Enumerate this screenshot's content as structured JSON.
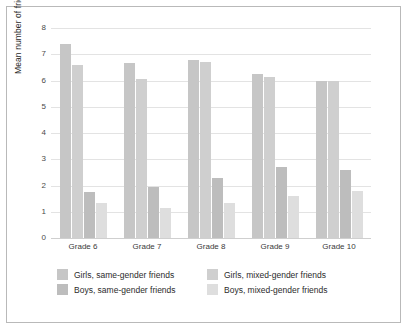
{
  "chart_data": {
    "type": "bar",
    "title": "",
    "xlabel": "",
    "ylabel": "Mean number of friends",
    "categories": [
      "Grade 6",
      "Grade 7",
      "Grade 8",
      "Grade 9",
      "Grade 10"
    ],
    "ylim": [
      0,
      8
    ],
    "yticks": [
      0,
      1,
      2,
      3,
      4,
      5,
      6,
      7,
      8
    ],
    "grid": true,
    "legend_position": "bottom",
    "series": [
      {
        "name": "Girls, same-gender friends",
        "color": "#c6c6c6",
        "values": [
          7.4,
          6.65,
          6.8,
          6.25,
          6.0
        ]
      },
      {
        "name": "Girls, mixed-gender friends",
        "color": "#cfcfcf",
        "values": [
          6.6,
          6.05,
          6.7,
          6.15,
          6.0
        ]
      },
      {
        "name": "Boys, same-gender friends",
        "color": "#bdbdbd",
        "values": [
          1.75,
          1.95,
          2.3,
          2.7,
          2.6
        ]
      },
      {
        "name": "Boys, mixed-gender friends",
        "color": "#dedede",
        "values": [
          1.35,
          1.15,
          1.35,
          1.6,
          1.8
        ]
      }
    ]
  },
  "legend": {
    "items": [
      {
        "label": "Girls, same-gender friends",
        "color": "#c6c6c6"
      },
      {
        "label": "Girls, mixed-gender friends",
        "color": "#cfcfcf"
      },
      {
        "label": "Boys, same-gender friends",
        "color": "#bdbdbd"
      },
      {
        "label": "Boys, mixed-gender friends",
        "color": "#dedede"
      }
    ]
  }
}
